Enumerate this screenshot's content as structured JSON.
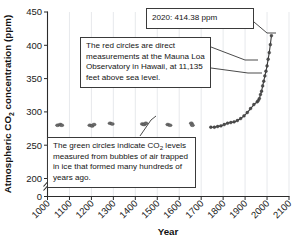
{
  "chart_data": {
    "type": "line",
    "title": "",
    "xlabel": "Year",
    "ylabel": "Atmospheric CO2 concentration (ppm)",
    "ylabel_parts": {
      "prefix": "Atmospheric CO",
      "sub": "2",
      "suffix": " concentration (ppm)"
    },
    "xlim": [
      1000,
      2100
    ],
    "ylim": [
      200,
      450
    ],
    "y_axis_broken": true,
    "y_break_between": [
      0,
      200
    ],
    "grid": "vertical-only",
    "legend": "none",
    "xticks": [
      1000,
      1100,
      1200,
      1300,
      1400,
      1500,
      1600,
      1700,
      1800,
      1900,
      2000,
      2100
    ],
    "xtick_labels": [
      "1000",
      "1100",
      "1200",
      "1300",
      "1400",
      "1500",
      "1600",
      "1700",
      "1800",
      "1900",
      "2000",
      "2100"
    ],
    "xtick_rotation_deg": 45,
    "yticks": [
      0,
      200,
      250,
      300,
      350,
      400,
      450
    ],
    "ytick_labels": [
      "0",
      "200",
      "250",
      "300",
      "350",
      "400",
      "450"
    ],
    "series": [
      {
        "name": "Ice core bubble measurements (green circles)",
        "marker": "circle",
        "color": "#2e7d32",
        "points": [
          {
            "x": 1046,
            "y": 280
          },
          {
            "x": 1058,
            "y": 281
          },
          {
            "x": 1065,
            "y": 280
          },
          {
            "x": 1193,
            "y": 280
          },
          {
            "x": 1203,
            "y": 279
          },
          {
            "x": 1212,
            "y": 281
          },
          {
            "x": 1285,
            "y": 283
          },
          {
            "x": 1295,
            "y": 282
          },
          {
            "x": 1432,
            "y": 282
          },
          {
            "x": 1440,
            "y": 281
          },
          {
            "x": 1448,
            "y": 283
          },
          {
            "x": 1548,
            "y": 281
          },
          {
            "x": 1558,
            "y": 280
          },
          {
            "x": 1655,
            "y": 283
          },
          {
            "x": 1660,
            "y": 280
          }
        ]
      },
      {
        "name": "Direct measurements, Mauna Loa Observatory (red circles)",
        "marker": "circle",
        "color": "#c62828",
        "points": [
          {
            "x": 1744,
            "y": 277
          },
          {
            "x": 1760,
            "y": 277
          },
          {
            "x": 1775,
            "y": 278
          },
          {
            "x": 1790,
            "y": 279
          },
          {
            "x": 1805,
            "y": 281
          },
          {
            "x": 1820,
            "y": 283
          },
          {
            "x": 1835,
            "y": 284
          },
          {
            "x": 1850,
            "y": 285
          },
          {
            "x": 1865,
            "y": 287
          },
          {
            "x": 1880,
            "y": 290
          },
          {
            "x": 1895,
            "y": 294
          },
          {
            "x": 1910,
            "y": 299
          },
          {
            "x": 1925,
            "y": 305
          },
          {
            "x": 1940,
            "y": 311
          },
          {
            "x": 1955,
            "y": 315
          },
          {
            "x": 1960,
            "y": 317
          },
          {
            "x": 1965,
            "y": 320
          },
          {
            "x": 1970,
            "y": 326
          },
          {
            "x": 1975,
            "y": 331
          },
          {
            "x": 1980,
            "y": 339
          },
          {
            "x": 1985,
            "y": 346
          },
          {
            "x": 1990,
            "y": 354
          },
          {
            "x": 1995,
            "y": 361
          },
          {
            "x": 2000,
            "y": 369
          },
          {
            "x": 2005,
            "y": 379
          },
          {
            "x": 2010,
            "y": 389
          },
          {
            "x": 2015,
            "y": 401
          },
          {
            "x": 2020,
            "y": 414.38
          }
        ]
      }
    ],
    "annotations": [
      {
        "id": "peak",
        "text": "2020: 414.38 ppm",
        "points_to": {
          "x": 2020,
          "y": 414.38
        }
      },
      {
        "id": "red-circles",
        "text": "The red circles are direct measurements at the Mauna Loa Observatory in Hawaii, at 11,135 feet above sea level.",
        "points_to": {
          "x": 2008,
          "y": 385
        }
      },
      {
        "id": "green-circles",
        "text_prefix": "The green circles indicate CO",
        "text_sub": "2",
        "text_suffix": " levels measured from bubbles of air trapped in ice that formed many hundreds of years ago.",
        "text": "The green circles indicate CO2 levels measured from bubbles of air trapped in ice that formed many hundreds of years ago.",
        "points_to": {
          "x": 1440,
          "y": 281
        }
      }
    ]
  },
  "colors": {
    "background": "#ffffff",
    "axis": "#2b2b2b",
    "grid": "#dcdfe4",
    "ice_series": "#2e7d32",
    "modern_series": "#c62828",
    "callout_border": "#3a3a3a"
  }
}
